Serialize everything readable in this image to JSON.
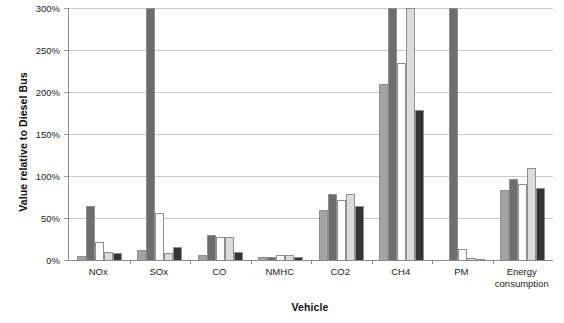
{
  "chart_data": {
    "type": "bar",
    "title": "",
    "xlabel": "Vehicle",
    "ylabel": "Value relative to Diesel Bus",
    "ylim": [
      0,
      300
    ],
    "ytick_values": [
      0,
      50,
      100,
      150,
      200,
      250,
      300
    ],
    "ytick_labels": [
      "0%",
      "50%",
      "100%",
      "150%",
      "200%",
      "250%",
      "300%"
    ],
    "grid": "horizontal",
    "legend": "none",
    "clipped_note": "Bars reaching the top of the plot are clipped at 300%",
    "categories": [
      "NOx",
      "SOx",
      "CO",
      "NMHC",
      "CO2",
      "CH4",
      "PM",
      "Energy\nconsumption"
    ],
    "series": [
      {
        "name": "Series 1",
        "color": "#a3a3a3",
        "values": [
          5,
          12,
          6,
          4,
          60,
          210,
          0,
          83
        ]
      },
      {
        "name": "Series 2",
        "color": "#6d6d6d",
        "values": [
          64,
          300,
          30,
          3,
          78,
          300,
          300,
          97
        ]
      },
      {
        "name": "Series 3",
        "color": "#fcfcfc",
        "values": [
          21,
          56,
          27,
          6,
          72,
          235,
          13,
          91
        ]
      },
      {
        "name": "Series 4",
        "color": "#dcdcdc",
        "values": [
          9,
          8,
          27,
          6,
          78,
          300,
          2,
          109
        ]
      },
      {
        "name": "Series 5",
        "color": "#343434",
        "values": [
          8,
          15,
          10,
          3,
          64,
          179,
          1,
          86
        ]
      }
    ]
  },
  "axes": {
    "y_title": "Value relative to Diesel Bus",
    "x_title": "Vehicle"
  }
}
